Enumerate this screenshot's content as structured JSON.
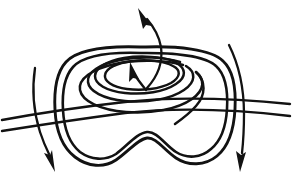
{
  "figure": {
    "kind": "line-art-diagram",
    "background_color": "#ffffff",
    "ink_color": "#121212",
    "canvas": {
      "width": 292,
      "height": 181
    }
  },
  "elements": {
    "outer_loop": {
      "name": "outer-rounded-loop",
      "description": "double-stranded rounded square loop with notched bottom",
      "stroke_width": 2.9
    },
    "inner_loop": {
      "name": "inner-rounded-loop",
      "description": "second strand of the outer band running parallel inside",
      "stroke_width": 2.6
    },
    "spiral": {
      "name": "nested-spiral",
      "description": "flattened nested spiral coil at the centre of the loop",
      "turns": 3,
      "stroke_width": 2.5
    },
    "horizontal_band": {
      "name": "horizontal-double-strand-band",
      "description": "two parallel near-horizontal strands crossing the figure left to right",
      "strands": 2,
      "stroke_width": 2.4
    },
    "arrows": [
      {
        "id": "center-arrow",
        "name": "spiral-center-arrow",
        "direction": "up-left",
        "description": "short arrow inside the spiral pointing up and to the left"
      },
      {
        "id": "top-arrow",
        "name": "top-exit-arrow",
        "direction": "up-left",
        "description": "long curved arrow emerging from the coil centre and exiting at the top"
      },
      {
        "id": "left-arrow",
        "name": "left-down-arrow",
        "direction": "down",
        "description": "curved arrow on the left side pointing downward across the band"
      },
      {
        "id": "right-arrow",
        "name": "right-down-arrow",
        "direction": "down",
        "description": "curved arrow on the right side pointing downward across the band"
      }
    ]
  }
}
